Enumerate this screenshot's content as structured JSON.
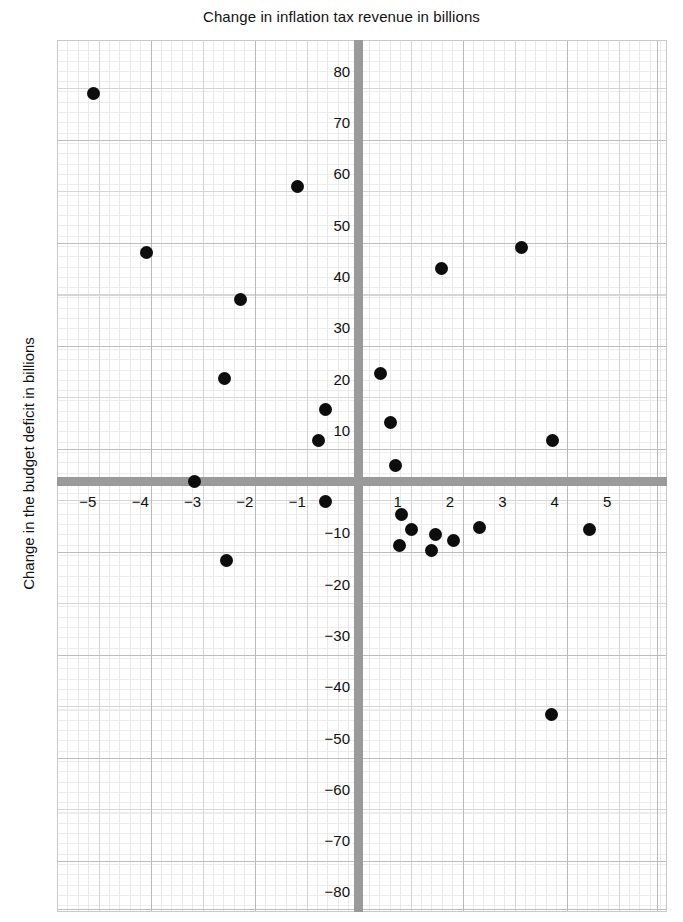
{
  "chart_data": {
    "type": "scatter",
    "title": "Change in inflation tax revenue in billions",
    "xlabel": "",
    "ylabel": "Change in the budget deficit in billions",
    "xlim": [
      -5.75,
      5.9
    ],
    "ylim": [
      -84,
      86
    ],
    "grid": true,
    "legend": null,
    "xticks": [
      -5,
      -4,
      -3,
      -2,
      -1,
      1,
      2,
      3,
      4,
      5
    ],
    "xtick_labels": [
      "−5",
      "−4",
      "−3",
      "−2",
      "−1",
      "1",
      "2",
      "3",
      "4",
      "5"
    ],
    "yticks": [
      80,
      70,
      60,
      50,
      40,
      30,
      20,
      10,
      -10,
      -20,
      -30,
      -40,
      -50,
      -60,
      -70,
      -80
    ],
    "ytick_labels": [
      "80",
      "70",
      "60",
      "50",
      "40",
      "30",
      "20",
      "10",
      "−10",
      "−20",
      "−30",
      "−40",
      "−50",
      "−60",
      "−70",
      "−80"
    ],
    "marker": "filled-circle",
    "marker_color": "#0d0d0d",
    "axis_color": "#9a9a9a",
    "points": [
      {
        "x": -5.05,
        "y": 75.5
      },
      {
        "x": -4.05,
        "y": 44.5
      },
      {
        "x": -3.12,
        "y": 0.0
      },
      {
        "x": -2.55,
        "y": 20.0
      },
      {
        "x": -2.52,
        "y": -15.5
      },
      {
        "x": -2.25,
        "y": 35.5
      },
      {
        "x": -1.15,
        "y": 57.5
      },
      {
        "x": -0.62,
        "y": 14.0
      },
      {
        "x": -0.75,
        "y": 8.0
      },
      {
        "x": -0.62,
        "y": -4.0
      },
      {
        "x": 0.42,
        "y": 21.0
      },
      {
        "x": 0.62,
        "y": 11.5
      },
      {
        "x": 0.72,
        "y": 3.0
      },
      {
        "x": 0.82,
        "y": -6.5
      },
      {
        "x": 1.02,
        "y": -9.5
      },
      {
        "x": 0.8,
        "y": -12.5
      },
      {
        "x": 1.48,
        "y": -10.5
      },
      {
        "x": 1.4,
        "y": -13.5
      },
      {
        "x": 1.82,
        "y": -11.5
      },
      {
        "x": 1.6,
        "y": 41.5
      },
      {
        "x": 2.32,
        "y": -9.0
      },
      {
        "x": 3.12,
        "y": 45.5
      },
      {
        "x": 3.72,
        "y": 8.0
      },
      {
        "x": 3.7,
        "y": -45.5
      },
      {
        "x": 4.42,
        "y": -9.5
      }
    ]
  }
}
